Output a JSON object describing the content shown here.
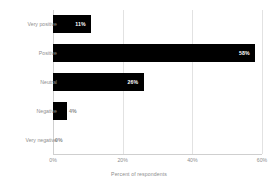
{
  "chart_data": {
    "type": "bar",
    "orientation": "horizontal",
    "title": "",
    "xlabel": "Percent of respondents",
    "ylabel": "",
    "categories": [
      "Very positive",
      "Positive",
      "Neutral",
      "Negative",
      "Very negative"
    ],
    "values": [
      11,
      58,
      26,
      4,
      0
    ],
    "data_labels": [
      "11%",
      "58%",
      "26%",
      "4%",
      "0%"
    ],
    "xlim": [
      0,
      60
    ],
    "xticks": [
      0,
      20,
      40,
      60
    ],
    "xtick_labels": [
      "0%",
      "20%",
      "40%",
      "60%"
    ],
    "grid": true,
    "grid_axis": "x",
    "legend": false,
    "bar_color": "#000000",
    "label_color_inside": "#ffffff",
    "label_color_outside": "#8a8a8a",
    "axis_text_color": "#8e8e8e",
    "gridline_color": "#e2e2e2",
    "background_color": "#ffffff"
  }
}
